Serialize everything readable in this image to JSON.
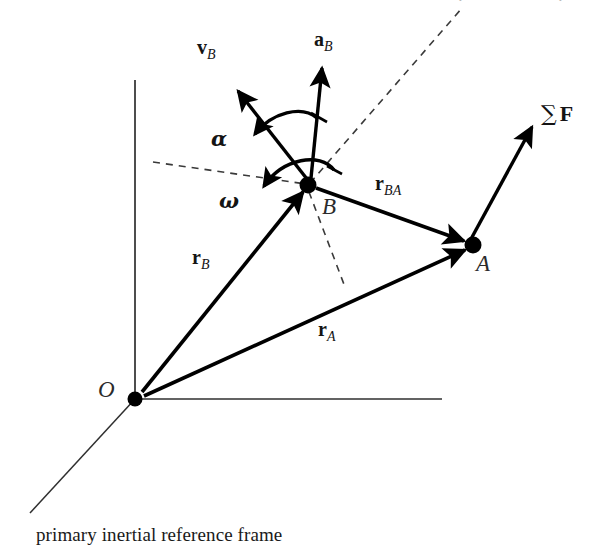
{
  "figure": {
    "caption": "primary inertial reference frame",
    "background_color": "#ffffff",
    "ink_color": "#000000",
    "width": 600,
    "height": 556
  },
  "points": [
    {
      "key": "O",
      "label": "O",
      "x": 135,
      "y": 399,
      "label_x": 100,
      "label_y": 380,
      "radius": 7
    },
    {
      "key": "B",
      "label": "B",
      "x": 308,
      "y": 185,
      "label_x": 322,
      "label_y": 196,
      "radius": 8
    },
    {
      "key": "A",
      "label": "A",
      "x": 473,
      "y": 245,
      "label_x": 478,
      "label_y": 253,
      "radius": 8
    }
  ],
  "axes": {
    "vertical": {
      "name": "vertical-axis",
      "x1": 135,
      "y1": 80,
      "x2": 135,
      "y2": 399
    },
    "horizontal": {
      "name": "horizontal-axis",
      "x1": 135,
      "y1": 399,
      "x2": 442,
      "y2": 399
    },
    "oblique": {
      "name": "oblique-axis",
      "x1": 135,
      "y1": 399,
      "x2": 30,
      "y2": 513
    }
  },
  "vectors": [
    {
      "key": "r_B",
      "label": "r",
      "subscript": "B",
      "from": "O",
      "to": "B",
      "x1": 141,
      "y1": 393,
      "x2": 303,
      "y2": 192,
      "label_x": 192,
      "label_y": 248
    },
    {
      "key": "r_A",
      "label": "r",
      "subscript": "A",
      "from": "O",
      "to": "A",
      "x1": 143,
      "y1": 396,
      "x2": 466,
      "y2": 249,
      "label_x": 318,
      "label_y": 320
    },
    {
      "key": "r_BA",
      "label": "r",
      "subscript": "BA",
      "from": "B",
      "to": "A",
      "x1": 315,
      "y1": 188,
      "x2": 466,
      "y2": 242,
      "label_x": 376,
      "label_y": 174
    },
    {
      "key": "v_B",
      "label": "v",
      "subscript": "B",
      "from": "B",
      "to": "velocity-tip",
      "x1": 306,
      "y1": 180,
      "x2": 236,
      "y2": 88,
      "label_x": 196,
      "label_y": 38
    },
    {
      "key": "a_B",
      "label": "a",
      "subscript": "B",
      "from": "B",
      "to": "acceleration-tip",
      "x1": 310,
      "y1": 178,
      "x2": 322,
      "y2": 64,
      "label_x": 315,
      "label_y": 30
    },
    {
      "key": "sum_F",
      "label": "∑",
      "bold_part": "F",
      "from": "A",
      "to": "force-tip",
      "x1": 471,
      "y1": 238,
      "x2": 533,
      "y2": 124,
      "label_x": 544,
      "label_y": 104
    }
  ],
  "angular_quantities": [
    {
      "key": "alpha",
      "label": "α",
      "description": "angular-acceleration-arc",
      "label_x": 212,
      "label_y": 128,
      "arrow_tip_x": 249,
      "arrow_tip_y": 153
    },
    {
      "key": "omega",
      "label": "ω",
      "description": "angular-velocity-arc",
      "label_x": 220,
      "label_y": 190,
      "arrow_tip_x": 256,
      "arrow_tip_y": 208
    }
  ],
  "dashed_lines": [
    {
      "key": "reference-dir-left",
      "name": "dashed-reference-left",
      "x1": 153,
      "y1": 162,
      "x2": 308,
      "y2": 185
    },
    {
      "key": "reference-dir-upright",
      "name": "dashed-reference-upright",
      "x1": 308,
      "y1": 185,
      "x2": 462,
      "y2": 8
    },
    {
      "key": "reference-dir-down",
      "name": "dashed-reference-down",
      "x1": 308,
      "y1": 185,
      "x2": 345,
      "y2": 287
    }
  ],
  "ghost_text": [
    {
      "key": "g1",
      "text": "·",
      "x": 460,
      "y": 0
    },
    {
      "key": "g2",
      "text": "·",
      "x": 560,
      "y": 0
    }
  ]
}
